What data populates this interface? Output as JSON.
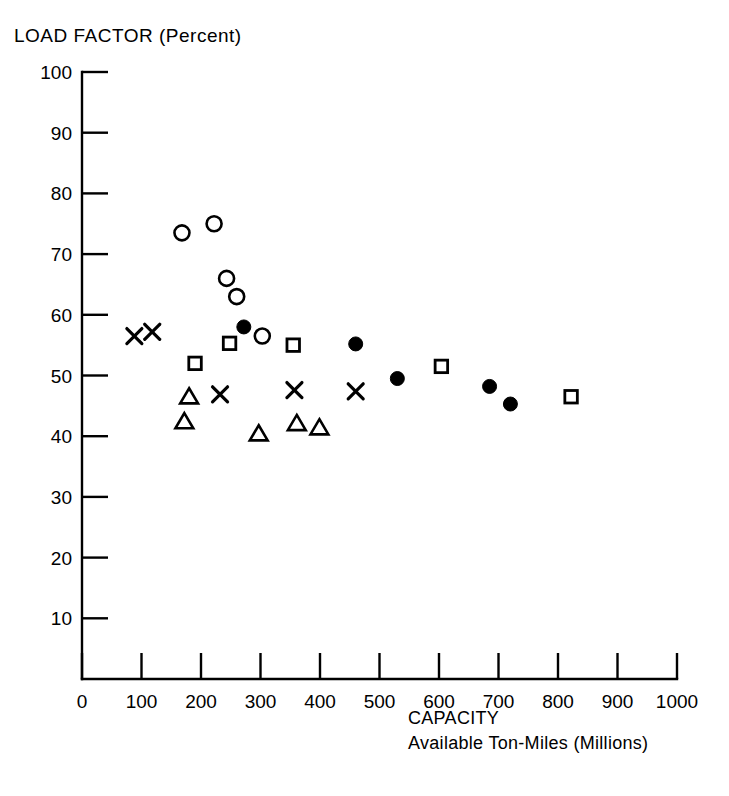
{
  "chart_data": {
    "type": "scatter",
    "title": "LOAD FACTOR (Percent)",
    "xlabel": "CAPACITY",
    "xlabel_line2": "Available Ton-Miles (Millions)",
    "ylabel": "LOAD FACTOR (Percent)",
    "xlim": [
      0,
      1000
    ],
    "ylim": [
      0,
      100
    ],
    "xticks": [
      0,
      100,
      200,
      300,
      400,
      500,
      600,
      700,
      800,
      900,
      1000
    ],
    "yticks": [
      10,
      20,
      30,
      40,
      50,
      60,
      70,
      80,
      90,
      100
    ],
    "xtick_labels": [
      "0",
      "100",
      "200",
      "300",
      "400",
      "500",
      "600",
      "700",
      "800",
      "900",
      "1000"
    ],
    "ytick_labels": [
      "10",
      "20",
      "30",
      "40",
      "50",
      "60",
      "70",
      "80",
      "90",
      "100"
    ],
    "grid": false,
    "legend": "none",
    "tick_direction": "inward",
    "axis_color": "#000000",
    "marker_color": "#000000",
    "series": [
      {
        "name": "open-circle",
        "marker": "circle-open",
        "points": [
          {
            "x": 168,
            "y": 73.5
          },
          {
            "x": 222,
            "y": 75.0
          },
          {
            "x": 243,
            "y": 66.0
          },
          {
            "x": 260,
            "y": 63.0
          },
          {
            "x": 303,
            "y": 56.5
          }
        ]
      },
      {
        "name": "filled-circle",
        "marker": "circle-filled",
        "points": [
          {
            "x": 272,
            "y": 58.0
          },
          {
            "x": 460,
            "y": 55.2
          },
          {
            "x": 530,
            "y": 49.5
          },
          {
            "x": 685,
            "y": 48.2
          },
          {
            "x": 720,
            "y": 45.3
          }
        ]
      },
      {
        "name": "open-square",
        "marker": "square-open",
        "points": [
          {
            "x": 190,
            "y": 52.0
          },
          {
            "x": 248,
            "y": 55.3
          },
          {
            "x": 355,
            "y": 55.0
          },
          {
            "x": 604,
            "y": 51.5
          },
          {
            "x": 822,
            "y": 46.5
          }
        ]
      },
      {
        "name": "cross-x",
        "marker": "x",
        "points": [
          {
            "x": 88,
            "y": 56.5
          },
          {
            "x": 118,
            "y": 57.2
          },
          {
            "x": 232,
            "y": 46.9
          },
          {
            "x": 357,
            "y": 47.6
          },
          {
            "x": 460,
            "y": 47.4
          }
        ]
      },
      {
        "name": "open-triangle",
        "marker": "triangle-open",
        "points": [
          {
            "x": 180,
            "y": 46.5
          },
          {
            "x": 172,
            "y": 42.4
          },
          {
            "x": 297,
            "y": 40.4
          },
          {
            "x": 361,
            "y": 42.1
          },
          {
            "x": 399,
            "y": 41.4
          }
        ]
      }
    ]
  }
}
